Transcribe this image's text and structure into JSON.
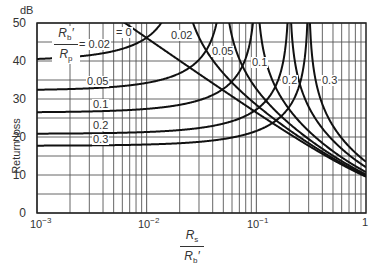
{
  "chart_data": {
    "type": "line",
    "title": "",
    "xlabel": "Rs / Rb'",
    "ylabel": "Return loss",
    "yunit": "dB",
    "xscale": "log",
    "xlim": [
      0.001,
      1
    ],
    "ylim": [
      0,
      50
    ],
    "grid": true,
    "x_ticks": [
      "10^-3",
      "10^-2",
      "10^-1",
      "1"
    ],
    "y_ticks": [
      0,
      10,
      20,
      30,
      40,
      50
    ],
    "legend_title": "Rb' / Rp",
    "series": [
      {
        "name": "0",
        "param": 0,
        "low_x_asymptote_db": null,
        "peak_x": 0
      },
      {
        "name": "0.02",
        "param": 0.02,
        "low_x_asymptote_db": 40,
        "peak_x": 0.02
      },
      {
        "name": "0.05",
        "param": 0.05,
        "low_x_asymptote_db": 32,
        "peak_x": 0.05
      },
      {
        "name": "0.1",
        "param": 0.1,
        "low_x_asymptote_db": 26,
        "peak_x": 0.1
      },
      {
        "name": "0.2",
        "param": 0.2,
        "low_x_asymptote_db": 20,
        "peak_x": 0.2
      },
      {
        "name": "0.3",
        "param": 0.3,
        "low_x_asymptote_db": 17,
        "peak_x": 0.3
      }
    ],
    "value_at_x_1_db": [
      9.5,
      9.4,
      9.2,
      8.9,
      8.3,
      7.8
    ]
  },
  "labels": {
    "unit": "dB",
    "y_axis": "Return loss",
    "y_ticks": [
      "50",
      "40",
      "30",
      "20",
      "10",
      "0"
    ],
    "x_tick_1_base": "10",
    "x_tick_1_exp": "−3",
    "x_tick_2_base": "10",
    "x_tick_2_exp": "−2",
    "x_tick_3_base": "10",
    "x_tick_3_exp": "−1",
    "x_tick_4": "1",
    "param_num": "R",
    "param_num_sub": "b",
    "param_num_prime": "′",
    "param_den": "R",
    "param_den_sub": "p",
    "xlabel_num": "R",
    "xlabel_num_sub": "s",
    "xlabel_den": "R",
    "xlabel_den_sub": "b",
    "xlabel_den_prime": "′",
    "curve_labels": [
      "= 0",
      "= 0.02",
      "0.02",
      "0.05",
      "0.05",
      "0.1",
      "0.1",
      "0.2",
      "0.2",
      "0.3",
      "0.3"
    ]
  }
}
